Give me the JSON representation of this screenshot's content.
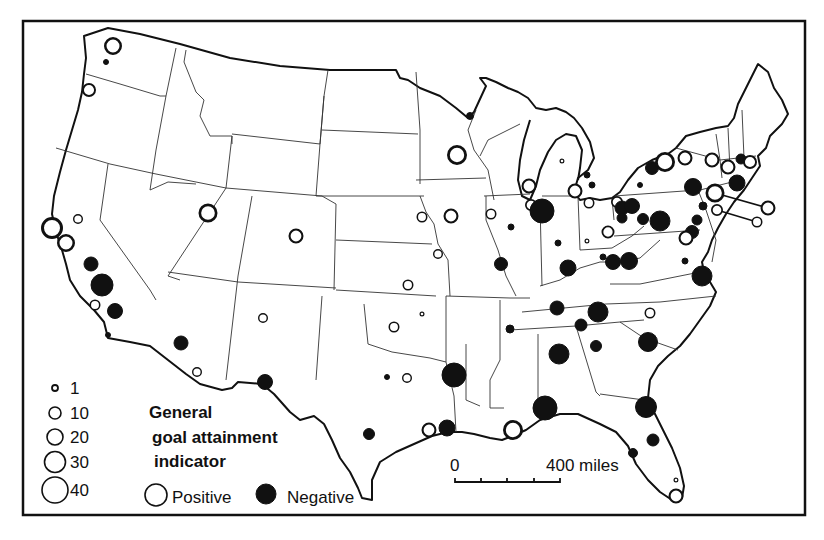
{
  "legend": {
    "title_lines": [
      "General",
      "goal attainment",
      "indicator"
    ],
    "sizes": [
      {
        "value": "1",
        "r": 3
      },
      {
        "value": "10",
        "r": 6
      },
      {
        "value": "20",
        "r": 8
      },
      {
        "value": "30",
        "r": 10.5
      },
      {
        "value": "40",
        "r": 13
      }
    ],
    "positive_label": "Positive",
    "negative_label": "Negative"
  },
  "scale_bar": {
    "start_label": "0",
    "end_label": "400 miles"
  },
  "colors": {
    "ink": "#111111",
    "paper": "#ffffff"
  },
  "circles": [
    {
      "x": 113,
      "y": 46,
      "r": 9,
      "type": "positive"
    },
    {
      "x": 106,
      "y": 62,
      "r": 2.5,
      "type": "negative"
    },
    {
      "x": 89,
      "y": 90,
      "r": 7,
      "type": "positive"
    },
    {
      "x": 52,
      "y": 228,
      "r": 11,
      "type": "positive"
    },
    {
      "x": 66,
      "y": 243,
      "r": 9,
      "type": "positive"
    },
    {
      "x": 78,
      "y": 219,
      "r": 5,
      "type": "positive"
    },
    {
      "x": 91,
      "y": 264,
      "r": 7,
      "type": "negative"
    },
    {
      "x": 102,
      "y": 285,
      "r": 11,
      "type": "negative"
    },
    {
      "x": 95,
      "y": 305,
      "r": 5.5,
      "type": "positive"
    },
    {
      "x": 115,
      "y": 311,
      "r": 7.5,
      "type": "negative"
    },
    {
      "x": 108,
      "y": 335,
      "r": 2.5,
      "type": "negative"
    },
    {
      "x": 208,
      "y": 213,
      "r": 9.5,
      "type": "positive"
    },
    {
      "x": 296,
      "y": 236,
      "r": 7.5,
      "type": "positive"
    },
    {
      "x": 181,
      "y": 343,
      "r": 7,
      "type": "negative"
    },
    {
      "x": 197,
      "y": 372,
      "r": 5,
      "type": "positive"
    },
    {
      "x": 263,
      "y": 318,
      "r": 5,
      "type": "positive"
    },
    {
      "x": 265,
      "y": 382,
      "r": 7.5,
      "type": "negative"
    },
    {
      "x": 457,
      "y": 155,
      "r": 10,
      "type": "positive"
    },
    {
      "x": 470,
      "y": 116,
      "r": 3.5,
      "type": "negative"
    },
    {
      "x": 422,
      "y": 217,
      "r": 5.5,
      "type": "positive"
    },
    {
      "x": 451,
      "y": 216,
      "r": 7.5,
      "type": "positive"
    },
    {
      "x": 491,
      "y": 214,
      "r": 5.5,
      "type": "positive"
    },
    {
      "x": 438,
      "y": 254,
      "r": 5,
      "type": "positive"
    },
    {
      "x": 408,
      "y": 285,
      "r": 5.5,
      "type": "positive"
    },
    {
      "x": 394,
      "y": 327,
      "r": 5.5,
      "type": "positive"
    },
    {
      "x": 422,
      "y": 314,
      "r": 2.5,
      "type": "positive"
    },
    {
      "x": 387,
      "y": 377,
      "r": 2.5,
      "type": "negative"
    },
    {
      "x": 407,
      "y": 378,
      "r": 5,
      "type": "positive"
    },
    {
      "x": 454,
      "y": 375,
      "r": 12,
      "type": "negative"
    },
    {
      "x": 369,
      "y": 434,
      "r": 5.5,
      "type": "negative"
    },
    {
      "x": 429,
      "y": 430,
      "r": 7.5,
      "type": "positive"
    },
    {
      "x": 447,
      "y": 428,
      "r": 8,
      "type": "negative"
    },
    {
      "x": 513,
      "y": 430,
      "r": 10,
      "type": "positive"
    },
    {
      "x": 545,
      "y": 408,
      "r": 12,
      "type": "negative"
    },
    {
      "x": 529,
      "y": 186,
      "r": 7.5,
      "type": "positive"
    },
    {
      "x": 531,
      "y": 205,
      "r": 6,
      "type": "positive"
    },
    {
      "x": 542,
      "y": 211,
      "r": 12,
      "type": "negative"
    },
    {
      "x": 511,
      "y": 227,
      "r": 3,
      "type": "negative"
    },
    {
      "x": 501,
      "y": 264,
      "r": 6.5,
      "type": "negative"
    },
    {
      "x": 558,
      "y": 243,
      "r": 3,
      "type": "negative"
    },
    {
      "x": 568,
      "y": 268,
      "r": 8,
      "type": "negative"
    },
    {
      "x": 575,
      "y": 191,
      "r": 7.5,
      "type": "positive"
    },
    {
      "x": 562,
      "y": 161,
      "r": 2.5,
      "type": "positive"
    },
    {
      "x": 587,
      "y": 175,
      "r": 3,
      "type": "negative"
    },
    {
      "x": 592,
      "y": 185,
      "r": 3,
      "type": "negative"
    },
    {
      "x": 589,
      "y": 203,
      "r": 5.5,
      "type": "positive"
    },
    {
      "x": 587,
      "y": 241,
      "r": 2.5,
      "type": "positive"
    },
    {
      "x": 608,
      "y": 232,
      "r": 6.5,
      "type": "positive"
    },
    {
      "x": 603,
      "y": 257,
      "r": 3,
      "type": "negative"
    },
    {
      "x": 613,
      "y": 262,
      "r": 7.5,
      "type": "negative"
    },
    {
      "x": 629,
      "y": 261,
      "r": 8.5,
      "type": "negative"
    },
    {
      "x": 617,
      "y": 202,
      "r": 6,
      "type": "positive"
    },
    {
      "x": 622,
      "y": 208,
      "r": 7,
      "type": "negative"
    },
    {
      "x": 632,
      "y": 206,
      "r": 7.5,
      "type": "negative"
    },
    {
      "x": 622,
      "y": 218,
      "r": 5,
      "type": "negative"
    },
    {
      "x": 643,
      "y": 219,
      "r": 5.5,
      "type": "negative"
    },
    {
      "x": 660,
      "y": 221,
      "r": 10,
      "type": "negative"
    },
    {
      "x": 652,
      "y": 168,
      "r": 6.5,
      "type": "negative"
    },
    {
      "x": 665,
      "y": 162,
      "r": 10,
      "type": "positive"
    },
    {
      "x": 685,
      "y": 158,
      "r": 7.5,
      "type": "positive"
    },
    {
      "x": 640,
      "y": 185,
      "r": 2.5,
      "type": "negative"
    },
    {
      "x": 693,
      "y": 187,
      "r": 8.5,
      "type": "negative"
    },
    {
      "x": 712,
      "y": 160,
      "r": 7.5,
      "type": "positive"
    },
    {
      "x": 728,
      "y": 167,
      "r": 7.5,
      "type": "positive"
    },
    {
      "x": 741,
      "y": 159,
      "r": 5,
      "type": "negative"
    },
    {
      "x": 750,
      "y": 162,
      "r": 7,
      "type": "positive"
    },
    {
      "x": 737,
      "y": 183,
      "r": 8,
      "type": "negative"
    },
    {
      "x": 715,
      "y": 193,
      "r": 9.5,
      "type": "positive"
    },
    {
      "x": 717,
      "y": 210,
      "r": 6,
      "type": "positive"
    },
    {
      "x": 703,
      "y": 206,
      "r": 4,
      "type": "negative"
    },
    {
      "x": 697,
      "y": 220,
      "r": 5,
      "type": "negative"
    },
    {
      "x": 692,
      "y": 232,
      "r": 6.5,
      "type": "negative"
    },
    {
      "x": 686,
      "y": 238,
      "r": 7.5,
      "type": "positive"
    },
    {
      "x": 685,
      "y": 261,
      "r": 3,
      "type": "negative"
    },
    {
      "x": 702,
      "y": 276,
      "r": 10,
      "type": "negative"
    },
    {
      "x": 768,
      "y": 208,
      "r": 7.5,
      "type": "positive",
      "leader_from": [
        715,
        193
      ]
    },
    {
      "x": 757,
      "y": 222,
      "r": 5.5,
      "type": "positive",
      "leader_from": [
        717,
        210
      ]
    },
    {
      "x": 557,
      "y": 308,
      "r": 7,
      "type": "negative"
    },
    {
      "x": 598,
      "y": 312,
      "r": 10,
      "type": "negative"
    },
    {
      "x": 581,
      "y": 325,
      "r": 6,
      "type": "negative"
    },
    {
      "x": 650,
      "y": 313,
      "r": 5.5,
      "type": "positive"
    },
    {
      "x": 510,
      "y": 329,
      "r": 4,
      "type": "negative"
    },
    {
      "x": 596,
      "y": 346,
      "r": 5.5,
      "type": "negative"
    },
    {
      "x": 559,
      "y": 354,
      "r": 10,
      "type": "negative"
    },
    {
      "x": 648,
      "y": 342,
      "r": 9.5,
      "type": "negative"
    },
    {
      "x": 646,
      "y": 407,
      "r": 10.5,
      "type": "negative"
    },
    {
      "x": 653,
      "y": 440,
      "r": 6,
      "type": "negative"
    },
    {
      "x": 633,
      "y": 453,
      "r": 4.5,
      "type": "negative"
    },
    {
      "x": 676,
      "y": 496,
      "r": 7.5,
      "type": "positive"
    },
    {
      "x": 676,
      "y": 480,
      "r": 2.5,
      "type": "positive"
    }
  ]
}
